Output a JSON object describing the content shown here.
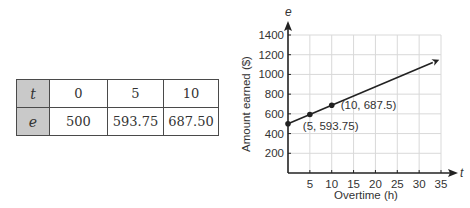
{
  "table": {
    "rows": [
      {
        "header": "t",
        "values": [
          "0",
          "5",
          "10"
        ]
      },
      {
        "header": "e",
        "values": [
          "500",
          "593.75",
          "687.50"
        ]
      }
    ]
  },
  "chart_data": {
    "type": "line",
    "title": "",
    "xlabel": "Overtime (h)",
    "ylabel": "Amount earned ($)",
    "x_var": "t",
    "y_var": "e",
    "xlim": [
      0,
      35
    ],
    "ylim": [
      0,
      1400
    ],
    "x_ticks": [
      5,
      10,
      15,
      20,
      25,
      30,
      35
    ],
    "y_ticks": [
      200,
      400,
      600,
      800,
      1000,
      1200,
      1400
    ],
    "grid": true,
    "series": [
      {
        "name": "e = 500 + 18.75t",
        "x": [
          0,
          5,
          10
        ],
        "y": [
          500,
          593.75,
          687.5
        ],
        "extends_to_x": 34.6,
        "arrow_end": true
      }
    ],
    "annotations": [
      {
        "text": "(5, 593.75)",
        "x": 5,
        "y": 593.75
      },
      {
        "text": "(10, 687.5)",
        "x": 10,
        "y": 687.5
      }
    ],
    "colors": {
      "line": "#222222",
      "grid": "#d9d9d9",
      "axis": "#222222"
    }
  }
}
